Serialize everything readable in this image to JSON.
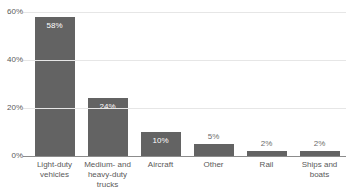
{
  "chart_data": {
    "type": "bar",
    "title": "",
    "subtitle": "",
    "xlabel": "",
    "ylabel": "",
    "categories": [
      "Light-duty vehicles",
      "Medium- and heavy-duty trucks",
      "Aircraft",
      "Other",
      "Rail",
      "Ships and boats"
    ],
    "values": [
      58,
      24,
      10,
      5,
      2,
      2
    ],
    "value_labels": [
      "58%",
      "24%",
      "10%",
      "5%",
      "2%",
      "2%"
    ],
    "label_placement": [
      "inside",
      "inside",
      "inside",
      "above",
      "above",
      "above"
    ],
    "ylim": [
      0,
      60
    ],
    "yticks": [
      0,
      20,
      40,
      60
    ],
    "ytick_labels": [
      "0%",
      "20%",
      "40%",
      "60%"
    ],
    "grid": true,
    "legend": false,
    "legend_position": "none",
    "bar_color": "#636363",
    "gridline_color": "#e6e6e6",
    "axis_color": "#8c8c8c",
    "inside_label_color": "#ffffff",
    "above_label_color": "#6b6b6b",
    "tick_label_color": "#595959"
  }
}
